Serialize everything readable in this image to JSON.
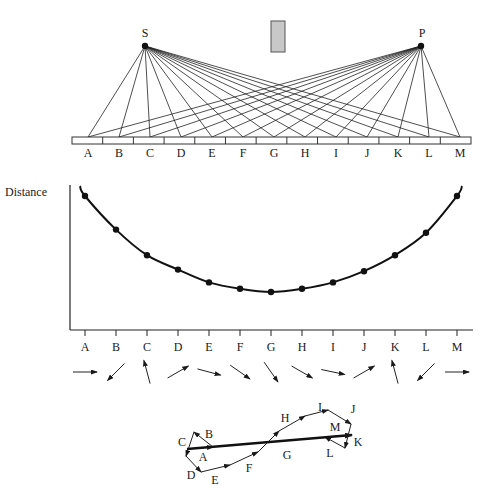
{
  "top_diagram": {
    "source_label": "S",
    "detector_label": "P",
    "source_pos": [
      145,
      46
    ],
    "detector_pos": [
      421,
      46
    ],
    "blocker": {
      "x": 271,
      "y": 21,
      "w": 14,
      "h": 31,
      "fill": "#c8c8c8"
    },
    "mirror": {
      "x": 72,
      "y": 137,
      "w": 399,
      "h": 7,
      "cells": 13
    },
    "points": [
      "A",
      "B",
      "C",
      "D",
      "E",
      "F",
      "G",
      "H",
      "I",
      "J",
      "K",
      "L",
      "M"
    ]
  },
  "chart_data": {
    "type": "line",
    "title": "",
    "ylabel": "Distance",
    "xlabel": "",
    "categories": [
      "A",
      "B",
      "C",
      "D",
      "E",
      "F",
      "G",
      "H",
      "I",
      "J",
      "K",
      "L",
      "M"
    ],
    "values": [
      10.0,
      7.9,
      6.3,
      5.4,
      4.6,
      4.2,
      4.0,
      4.2,
      4.6,
      5.3,
      6.3,
      7.7,
      10.0
    ],
    "ylim": [
      0,
      11
    ],
    "grid": false,
    "legend": "none"
  },
  "arrows": {
    "labels": [
      "A",
      "B",
      "C",
      "D",
      "E",
      "F",
      "G",
      "H",
      "I",
      "J",
      "K",
      "L",
      "M"
    ],
    "angles_deg": [
      0,
      225,
      105,
      30,
      -15,
      -35,
      -55,
      -30,
      -12,
      30,
      105,
      225,
      0
    ]
  },
  "phasor_sum": {
    "labels": [
      "A",
      "B",
      "C",
      "D",
      "E",
      "F",
      "G",
      "H",
      "I",
      "J",
      "K",
      "L",
      "M"
    ],
    "path": [
      [
        187,
        449
      ],
      [
        213,
        447
      ],
      [
        194,
        432
      ],
      [
        186,
        456
      ],
      [
        201,
        472
      ],
      [
        230,
        465
      ],
      [
        258,
        452
      ],
      [
        279,
        431
      ],
      [
        305,
        416
      ],
      [
        328,
        410
      ],
      [
        351,
        424
      ],
      [
        345,
        448
      ],
      [
        325,
        437
      ],
      [
        351,
        435
      ]
    ],
    "resultant": {
      "from": [
        187,
        449
      ],
      "to": [
        352,
        435
      ]
    }
  }
}
